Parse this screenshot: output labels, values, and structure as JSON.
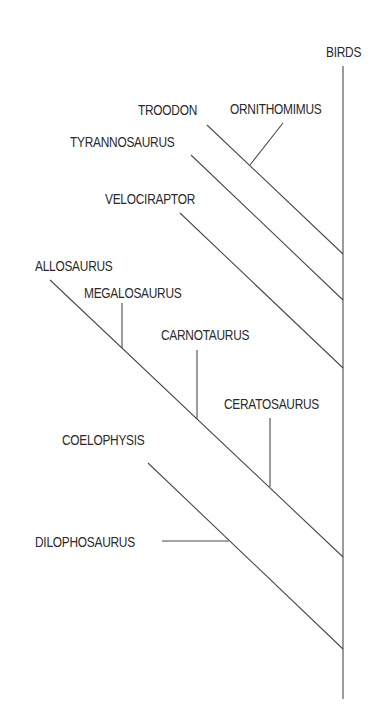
{
  "diagram": {
    "type": "cladogram",
    "line_color": "#4a4a4a",
    "text_color": "#2a2a2a",
    "taxa": [
      {
        "id": "birds",
        "label": "BIRDS"
      },
      {
        "id": "troodon",
        "label": "TROODON"
      },
      {
        "id": "ornithomimus",
        "label": "ORNITHOMIMUS"
      },
      {
        "id": "tyrannosaurus",
        "label": "TYRANNOSAURUS"
      },
      {
        "id": "velociraptor",
        "label": "VELOCIRAPTOR"
      },
      {
        "id": "allosaurus",
        "label": "ALLOSAURUS"
      },
      {
        "id": "megalosaurus",
        "label": "MEGALOSAURUS"
      },
      {
        "id": "carnotaurus",
        "label": "CARNOTAURUS"
      },
      {
        "id": "ceratosaurus",
        "label": "CERATOSAURUS"
      },
      {
        "id": "coelophysis",
        "label": "COELOPHYSIS"
      },
      {
        "id": "dilophosaurus",
        "label": "DILOPHOSAURUS"
      }
    ],
    "relationships": [
      {
        "child": "ornithomimus",
        "joins": "troodon"
      },
      {
        "child": "troodon",
        "joins": "birds"
      },
      {
        "child": "tyrannosaurus",
        "joins": "birds"
      },
      {
        "child": "velociraptor",
        "joins": "birds"
      },
      {
        "child": "megalosaurus",
        "joins": "allosaurus"
      },
      {
        "child": "carnotaurus",
        "joins": "allosaurus"
      },
      {
        "child": "ceratosaurus",
        "joins": "allosaurus"
      },
      {
        "child": "allosaurus",
        "joins": "birds"
      },
      {
        "child": "dilophosaurus",
        "joins": "coelophysis"
      },
      {
        "child": "coelophysis",
        "joins": "birds"
      }
    ]
  }
}
